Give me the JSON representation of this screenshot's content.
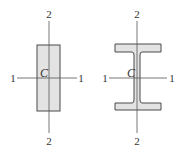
{
  "diagram": {
    "colors": {
      "fill": "#e3e3e3",
      "stroke": "#4a4a4a",
      "axis": "#555555"
    },
    "rectangle_section": {
      "centroid_label": "C",
      "axis1_left_label": "1",
      "axis1_right_label": "1",
      "axis2_top_label": "2",
      "axis2_bottom_label": "2"
    },
    "i_beam_section": {
      "centroid_label": "C",
      "axis1_left_label": "1",
      "axis1_right_label": "1",
      "axis2_top_label": "2",
      "axis2_bottom_label": "2"
    }
  }
}
